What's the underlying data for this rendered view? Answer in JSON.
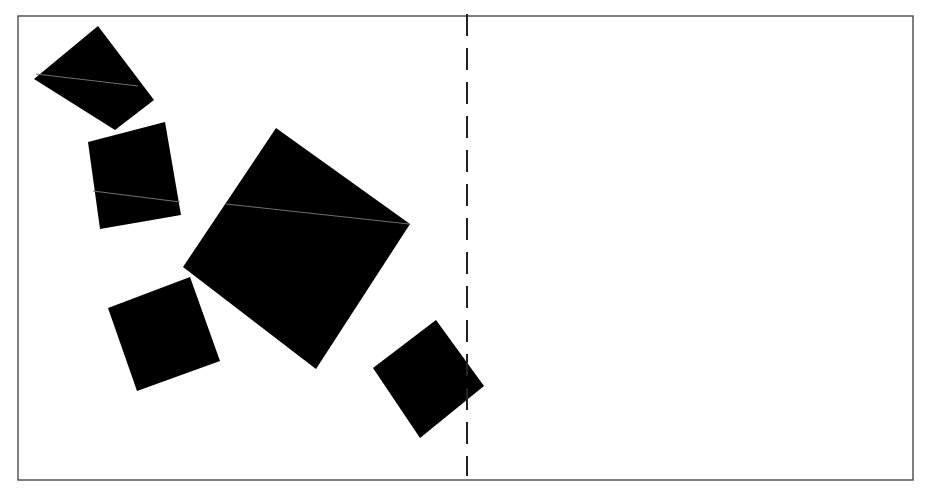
{
  "diagram": {
    "colors": {
      "background": "#ffffff",
      "frame": "#555555",
      "divider": "#222222",
      "shape_fill": "#000000",
      "crease": "#6f6f6f"
    },
    "frame": {
      "x1": 18,
      "y1": 16,
      "x2": 913,
      "y2": 480
    },
    "divider": {
      "x": 467,
      "y1": 14,
      "y2": 476,
      "dash": "22 12"
    },
    "squares": [
      {
        "name": "square-top-left",
        "points": "98,26 154,100 115,130 34,79",
        "crease": "36,74 138,86"
      },
      {
        "name": "square-upper-mid",
        "points": "88,142 165,122 181,215 100,229",
        "crease": "93,191 180,202"
      },
      {
        "name": "square-large-center",
        "points": "276,128 410,224 316,369 183,267",
        "crease": "226,204 409,224"
      },
      {
        "name": "square-lower-left",
        "points": "108,308 190,277 220,361 137,391",
        "crease": ""
      },
      {
        "name": "square-bottom-right",
        "points": "373,368 436,320 484,386 420,438",
        "crease": ""
      }
    ]
  }
}
